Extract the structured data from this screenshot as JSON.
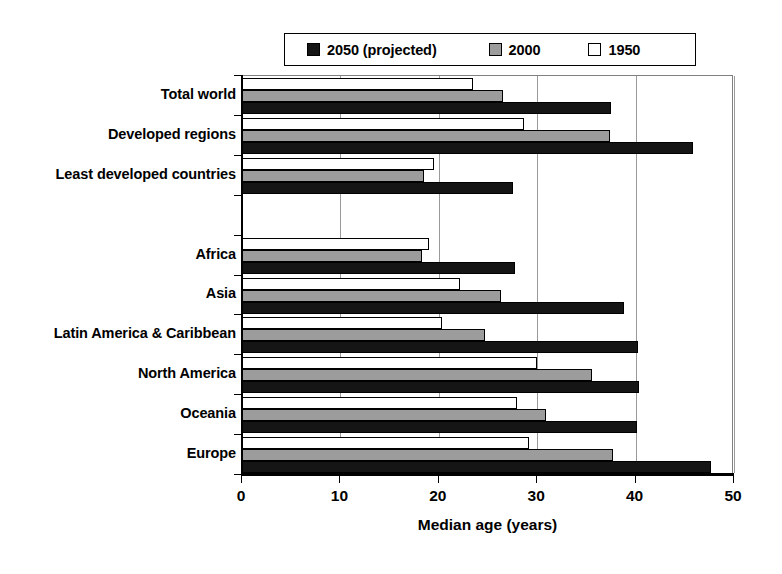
{
  "chart_data": {
    "type": "bar",
    "orientation": "horizontal",
    "title": "",
    "xlabel": "Median age (years)",
    "ylabel": "",
    "xlim": [
      0,
      50
    ],
    "xticks": [
      0,
      10,
      20,
      30,
      40,
      50
    ],
    "xtick_labels": [
      "0",
      "10",
      "20",
      "30",
      "40",
      "50"
    ],
    "grid": "vertical",
    "legend_position": "top",
    "categories": [
      "Total world",
      "Developed regions",
      "Least developed countries",
      "",
      "Africa",
      "Asia",
      "Latin America & Caribbean",
      "North America",
      "Oceania",
      "Europe"
    ],
    "series": [
      {
        "name": "1950",
        "color": "#ffffff",
        "values": [
          23.5,
          28.7,
          19.5,
          null,
          19.0,
          22.2,
          20.3,
          30.0,
          27.9,
          29.2
        ]
      },
      {
        "name": "2000",
        "color": "#9c9c9c",
        "values": [
          26.5,
          37.4,
          18.5,
          null,
          18.3,
          26.3,
          24.7,
          35.6,
          30.9,
          37.7
        ]
      },
      {
        "name": "2050 (projected)",
        "color": "#151515",
        "values": [
          37.5,
          45.8,
          27.5,
          null,
          27.7,
          38.8,
          40.2,
          40.3,
          40.1,
          47.7
        ]
      }
    ]
  },
  "legend": {
    "entries": [
      {
        "label": "2050 (projected)",
        "color": "#151515"
      },
      {
        "label": "2000",
        "color": "#9c9c9c"
      },
      {
        "label": "1950",
        "color": "#ffffff"
      }
    ]
  },
  "axis": {
    "x_title": "Median age (years)"
  }
}
